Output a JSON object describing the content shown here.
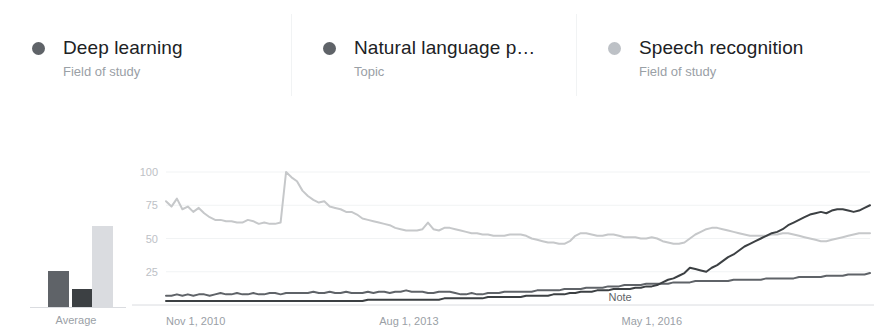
{
  "legend": {
    "items": [
      {
        "title": "Deep learning",
        "subtitle": "Field of study",
        "color": "#5f6368",
        "dot_name": "legend-dot-deep-learning"
      },
      {
        "title": "Natural language p…",
        "subtitle": "Topic",
        "color": "#5f6368",
        "dot_name": "legend-dot-natural-language-processing"
      },
      {
        "title": "Speech recognition",
        "subtitle": "Field of study",
        "color": "#bdc1c6",
        "dot_name": "legend-dot-speech-recognition"
      }
    ]
  },
  "mini_chart": {
    "label": "Average",
    "bars": [
      {
        "name": "Deep learning",
        "value": 28,
        "color": "#5f6368"
      },
      {
        "name": "Natural language processing",
        "value": 14,
        "color": "#3c4043"
      },
      {
        "name": "Speech recognition",
        "value": 62,
        "color": "#dadce0"
      }
    ]
  },
  "chart_data": {
    "type": "line",
    "title": "",
    "xlabel": "",
    "ylabel": "",
    "ylim": [
      0,
      100
    ],
    "yticks": [
      25,
      50,
      75,
      100
    ],
    "grid": true,
    "legend_position": "top",
    "annotations": [
      {
        "text": "Note",
        "x": "2016-01-01",
        "y": 4
      }
    ],
    "xticks": [
      {
        "label": "Nov 1, 2010",
        "x": "2010-11-01"
      },
      {
        "label": "Aug 1, 2013",
        "x": "2013-08-01"
      },
      {
        "label": "May 1, 2016",
        "x": "2016-05-01"
      }
    ],
    "x_start": "2010-11-01",
    "x_end": "2018-10-01",
    "series": [
      {
        "name": "Speech recognition",
        "color": "#c6c8ca",
        "values": [
          78,
          74,
          80,
          72,
          74,
          70,
          73,
          69,
          66,
          64,
          64,
          63,
          63,
          62,
          62,
          64,
          63,
          61,
          62,
          61,
          61,
          62,
          100,
          96,
          93,
          86,
          82,
          79,
          77,
          78,
          74,
          73,
          72,
          70,
          70,
          68,
          65,
          64,
          63,
          62,
          61,
          60,
          58,
          57,
          56,
          56,
          56,
          57,
          62,
          57,
          56,
          58,
          58,
          57,
          56,
          55,
          54,
          54,
          53,
          53,
          52,
          52,
          52,
          53,
          53,
          53,
          52,
          50,
          49,
          48,
          47,
          47,
          46,
          46,
          48,
          52,
          54,
          54,
          53,
          52,
          52,
          53,
          53,
          52,
          51,
          51,
          51,
          50,
          50,
          51,
          50,
          48,
          47,
          46,
          46,
          47,
          50,
          53,
          55,
          57,
          58,
          58,
          57,
          56,
          55,
          54,
          53,
          52,
          52,
          52,
          52,
          53,
          53,
          54,
          54,
          53,
          52,
          51,
          50,
          49,
          48,
          48,
          49,
          50,
          51,
          52,
          53,
          54,
          54,
          54
        ]
      },
      {
        "name": "Natural language processing",
        "color": "#5f6368",
        "values": [
          7,
          7,
          8,
          7,
          8,
          7,
          8,
          8,
          7,
          8,
          9,
          8,
          8,
          9,
          8,
          8,
          9,
          8,
          8,
          9,
          9,
          8,
          9,
          9,
          9,
          9,
          9,
          10,
          9,
          9,
          10,
          9,
          9,
          10,
          9,
          9,
          9,
          10,
          9,
          10,
          10,
          9,
          10,
          10,
          11,
          10,
          10,
          10,
          9,
          9,
          10,
          10,
          10,
          9,
          8,
          8,
          9,
          8,
          8,
          9,
          9,
          9,
          10,
          10,
          10,
          10,
          10,
          10,
          11,
          11,
          11,
          11,
          11,
          12,
          12,
          12,
          12,
          13,
          13,
          13,
          13,
          14,
          14,
          14,
          15,
          15,
          15,
          15,
          16,
          16,
          16,
          16,
          16,
          17,
          17,
          17,
          17,
          18,
          18,
          18,
          18,
          18,
          18,
          18,
          19,
          19,
          19,
          19,
          19,
          19,
          20,
          20,
          20,
          20,
          20,
          20,
          21,
          21,
          21,
          21,
          21,
          22,
          22,
          22,
          22,
          23,
          23,
          23,
          23,
          24
        ]
      },
      {
        "name": "Deep learning",
        "color": "#3c4043",
        "values": [
          3,
          3,
          3,
          3,
          3,
          3,
          3,
          3,
          3,
          3,
          3,
          3,
          3,
          3,
          3,
          3,
          3,
          3,
          3,
          3,
          3,
          3,
          3,
          3,
          3,
          3,
          3,
          3,
          3,
          3,
          3,
          3,
          3,
          3,
          3,
          3,
          3,
          4,
          4,
          4,
          4,
          4,
          4,
          4,
          4,
          4,
          4,
          4,
          4,
          4,
          4,
          5,
          5,
          5,
          5,
          5,
          5,
          5,
          5,
          6,
          6,
          6,
          6,
          6,
          6,
          6,
          7,
          7,
          7,
          7,
          7,
          8,
          8,
          8,
          9,
          9,
          10,
          10,
          10,
          11,
          11,
          11,
          12,
          12,
          12,
          12,
          13,
          13,
          14,
          14,
          15,
          17,
          19,
          20,
          22,
          24,
          28,
          27,
          26,
          25,
          28,
          30,
          33,
          36,
          38,
          41,
          44,
          46,
          48,
          50,
          52,
          54,
          55,
          57,
          60,
          62,
          64,
          66,
          68,
          69,
          70,
          69,
          71,
          72,
          72,
          71,
          70,
          71,
          73,
          75
        ]
      }
    ]
  }
}
